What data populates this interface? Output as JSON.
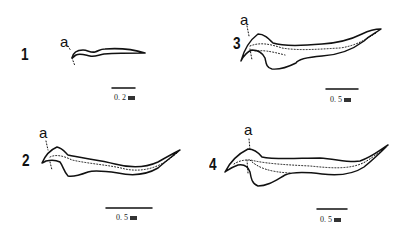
{
  "figure": {
    "type": "morphological line drawings (4 panels)",
    "panels": [
      {
        "id": "1",
        "number": "1",
        "marker": "a",
        "scale_value": "0. 2",
        "scale_unit": "mm"
      },
      {
        "id": "2",
        "number": "2",
        "marker": "a",
        "scale_value": "0. 5",
        "scale_unit": "mm"
      },
      {
        "id": "3",
        "number": "3",
        "marker": "a",
        "scale_value": "0. 5",
        "scale_unit": "mm"
      },
      {
        "id": "4",
        "number": "4",
        "marker": "a",
        "scale_value": "0. 5",
        "scale_unit": "mm"
      }
    ],
    "colors": {
      "line": "#111111",
      "background": "#ffffff"
    }
  }
}
